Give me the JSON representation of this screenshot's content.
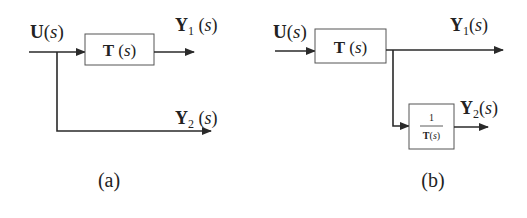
{
  "figure": {
    "panels": [
      {
        "id": "a",
        "caption": "(a)",
        "input": {
          "var": "U",
          "arg": "s",
          "open": "(",
          "close": ")"
        },
        "block": {
          "name": "T",
          "arg": "s",
          "label_full": "T (s)"
        },
        "outputs": [
          {
            "var": "Y",
            "sub": "1",
            "arg": "s",
            "label_full": "Y1 (s)"
          },
          {
            "var": "Y",
            "sub": "2",
            "arg": "s",
            "label_full": "Y2 (s)"
          }
        ]
      },
      {
        "id": "b",
        "caption": "(b)",
        "input": {
          "var": "U",
          "arg": "s",
          "open": "(",
          "close": ")"
        },
        "block": {
          "name": "T",
          "arg": "s",
          "label_full": "T (s)"
        },
        "inverse_block": {
          "numerator": "1",
          "den_name": "T",
          "den_arg": "s",
          "label_full": "1/T(s)"
        },
        "outputs": [
          {
            "var": "Y",
            "sub": "1",
            "arg": "s",
            "label_full": "Y1(s)"
          },
          {
            "var": "Y",
            "sub": "2",
            "arg": "s",
            "label_full": "Y2(s)"
          }
        ]
      }
    ]
  }
}
